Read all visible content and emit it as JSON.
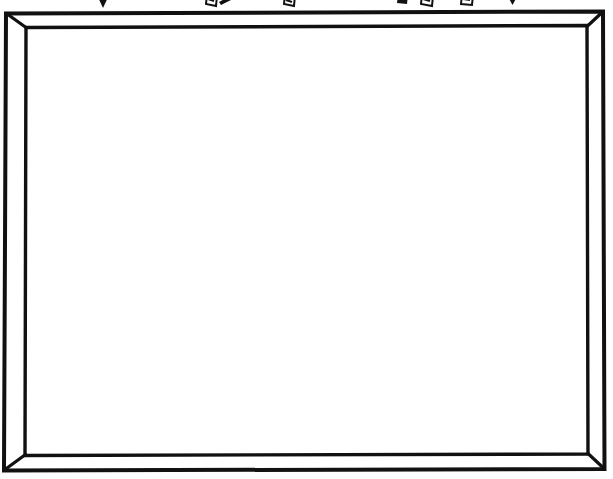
{
  "page": {
    "width": 613,
    "height": 479,
    "background_color": "#ffffff",
    "ink_color": "#0d0d0d"
  },
  "frame": {
    "name": "beveled-rectangular-frame",
    "style": "hand-drawn double-line picture frame with mitered corners",
    "stroke_color": "#111111",
    "fill_color": "#ffffff",
    "outer": {
      "left": 5,
      "top": 12,
      "right": 604,
      "bottom": 470
    },
    "inner": {
      "left": 26,
      "top": 27,
      "right": 587,
      "bottom": 454
    },
    "corners": [
      "top-left",
      "top-right",
      "bottom-left",
      "bottom-right"
    ],
    "corner_join": "mitered",
    "stroke_width_outer": 4,
    "stroke_width_inner": 3
  },
  "board": {
    "name": "whiteboard-surface",
    "content": "",
    "fill_color": "#ffffff",
    "is_blank": true
  },
  "top_strip": {
    "label": "clipped toolbar glyph row",
    "clipped": true,
    "visible_height": 9,
    "glyphs": [
      {
        "name": "chevron-down-icon",
        "shape": "triangle-down",
        "x": 95,
        "width": 16
      },
      {
        "name": "cursor-arrow-icon",
        "shape": "flag-quad",
        "x": 205,
        "width": 14
      },
      {
        "name": "pointer-tail-icon",
        "shape": "slab",
        "x": 219,
        "width": 16
      },
      {
        "name": "cursor-arrow-icon",
        "shape": "flag-quad",
        "x": 283,
        "width": 14
      },
      {
        "name": "cursor-arrow-icon",
        "shape": "flag-quad",
        "x": 397,
        "width": 13
      },
      {
        "name": "cursor-arrow-icon",
        "shape": "flag-quad",
        "x": 420,
        "width": 15
      },
      {
        "name": "cursor-arrow-icon",
        "shape": "flag-quad",
        "x": 460,
        "width": 15
      },
      {
        "name": "chevron-down-icon",
        "shape": "triangle-down",
        "x": 507,
        "width": 11
      }
    ]
  }
}
